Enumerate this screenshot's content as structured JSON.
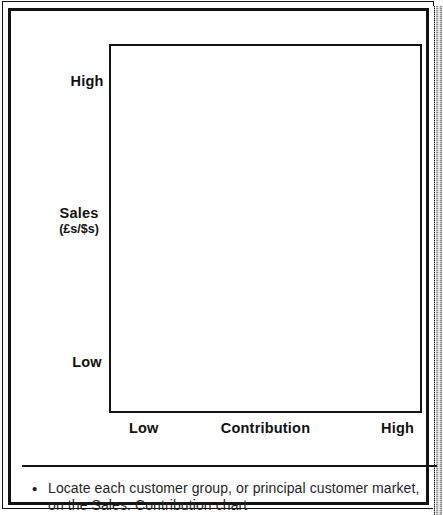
{
  "chart_data": {
    "type": "scatter",
    "title": "",
    "subtitle": "",
    "xlabel": "Contribution",
    "ylabel": "Sales",
    "ylabel_units": "(£s/$s)",
    "x_tick_labels": [
      "Low",
      "High"
    ],
    "y_tick_labels": [
      "High",
      "Low"
    ],
    "xlim": [
      "Low",
      "High"
    ],
    "ylim": [
      "Low",
      "High"
    ],
    "grid": false,
    "legend": null,
    "series": [],
    "values": [],
    "categories": [],
    "annotations": [],
    "note": "Empty 2x2 positioning grid — no data points plotted; axes are qualitative Low/High scales."
  },
  "chart": {
    "y_axis": {
      "high_label": "High",
      "low_label": "Low",
      "title": "Sales",
      "units": "(£s/$s)"
    },
    "x_axis": {
      "low_label": "Low",
      "title": "Contribution",
      "high_label": "High"
    }
  },
  "note": {
    "bullet": "•",
    "text": "Locate each customer group, or principal customer market, on the Sales: Contribution chart"
  },
  "colors": {
    "ink": "#121212",
    "paper": "#ffffff",
    "shadow": "#9a9a9a"
  }
}
